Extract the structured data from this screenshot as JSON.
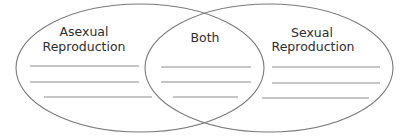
{
  "diagram": {
    "type": "venn",
    "sets": [
      {
        "id": "left",
        "title_lines": [
          "Asexual",
          "Reproduction"
        ],
        "write_lines": 3
      },
      {
        "id": "overlap",
        "title_lines": [
          "Both"
        ],
        "write_lines": 3
      },
      {
        "id": "right",
        "title_lines": [
          "Sexual",
          "Reproduction"
        ],
        "write_lines": 3
      }
    ],
    "colors": {
      "outline": "#7a7a7a",
      "write_line": "#8c8c8c",
      "text": "#2e2e2e",
      "background": "#ffffff"
    }
  }
}
